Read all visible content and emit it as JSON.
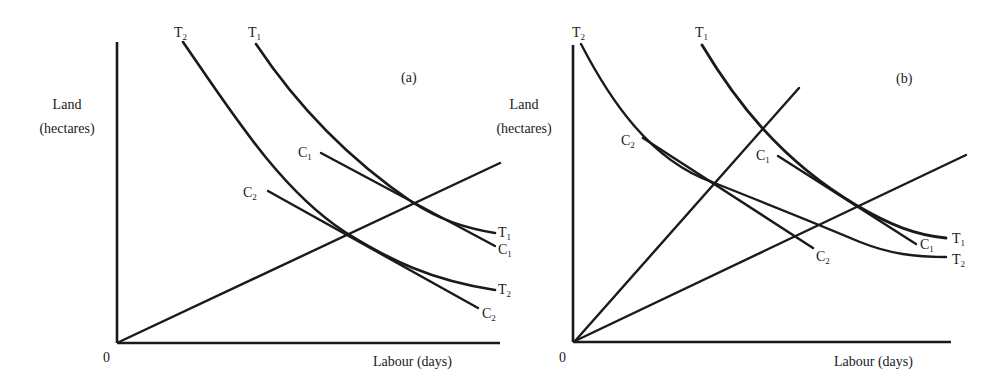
{
  "panels": [
    {
      "id": "a",
      "tag": "(a)",
      "y_axis_label_line1": "Land",
      "y_axis_label_line2": "(hectares)",
      "x_axis_label": "Labour (days)",
      "origin_label": "0",
      "isoquants": [
        {
          "name": "T",
          "sub": "2",
          "top_label": "T",
          "end_label": "T"
        },
        {
          "name": "T",
          "sub": "1",
          "top_label": "T",
          "end_label": "T"
        }
      ],
      "isocosts": [
        {
          "name": "C",
          "sub": "1"
        },
        {
          "name": "C",
          "sub": "2"
        }
      ],
      "expansion_paths": 1
    },
    {
      "id": "b",
      "tag": "(b)",
      "y_axis_label_line1": "Land",
      "y_axis_label_line2": "(hectares)",
      "x_axis_label": "Labour (days)",
      "origin_label": "0",
      "isoquants": [
        {
          "name": "T",
          "sub": "2"
        },
        {
          "name": "T",
          "sub": "1"
        }
      ],
      "isocosts": [
        {
          "name": "C",
          "sub": "2"
        },
        {
          "name": "C",
          "sub": "1"
        }
      ],
      "expansion_paths": 2
    }
  ],
  "labels": {
    "T": "T",
    "C": "C",
    "s1": "1",
    "s2": "2"
  },
  "colors": {
    "ink": "#1a1a1a",
    "background": "#ffffff"
  }
}
